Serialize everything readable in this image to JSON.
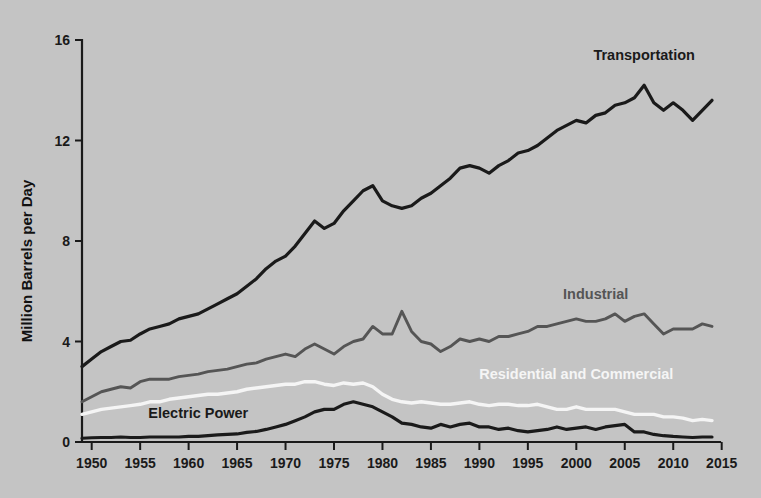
{
  "chart_data": {
    "type": "line",
    "title": "",
    "xlabel": "",
    "ylabel": "Million Barrels per Day",
    "xlim": [
      1949,
      2015
    ],
    "ylim": [
      0,
      16
    ],
    "yticks": [
      0,
      4,
      8,
      12,
      16
    ],
    "xticks": [
      1950,
      1955,
      1960,
      1965,
      1970,
      1975,
      1980,
      1985,
      1990,
      1995,
      2000,
      2005,
      2010,
      2015
    ],
    "grid": false,
    "legend_position": "inline-labels",
    "x": [
      1949,
      1950,
      1951,
      1952,
      1953,
      1954,
      1955,
      1956,
      1957,
      1958,
      1959,
      1960,
      1961,
      1962,
      1963,
      1964,
      1965,
      1966,
      1967,
      1968,
      1969,
      1970,
      1971,
      1972,
      1973,
      1974,
      1975,
      1976,
      1977,
      1978,
      1979,
      1980,
      1981,
      1982,
      1983,
      1984,
      1985,
      1986,
      1987,
      1988,
      1989,
      1990,
      1991,
      1992,
      1993,
      1994,
      1995,
      1996,
      1997,
      1998,
      1999,
      2000,
      2001,
      2002,
      2003,
      2004,
      2005,
      2006,
      2007,
      2008,
      2009,
      2010,
      2011,
      2012,
      2013,
      2014
    ],
    "series": [
      {
        "name": "Transportation",
        "color": "#1a1a1a",
        "label_x": 2007,
        "label_y": 15.2,
        "values": [
          3.0,
          3.3,
          3.6,
          3.8,
          4.0,
          4.05,
          4.3,
          4.5,
          4.6,
          4.7,
          4.9,
          5.0,
          5.1,
          5.3,
          5.5,
          5.7,
          5.9,
          6.2,
          6.5,
          6.9,
          7.2,
          7.4,
          7.8,
          8.3,
          8.8,
          8.5,
          8.7,
          9.2,
          9.6,
          10.0,
          10.2,
          9.6,
          9.4,
          9.3,
          9.4,
          9.7,
          9.9,
          10.2,
          10.5,
          10.9,
          11.0,
          10.9,
          10.7,
          11.0,
          11.2,
          11.5,
          11.6,
          11.8,
          12.1,
          12.4,
          12.6,
          12.8,
          12.7,
          13.0,
          13.1,
          13.4,
          13.5,
          13.7,
          14.2,
          13.5,
          13.2,
          13.5,
          13.2,
          12.8,
          13.2,
          13.6
        ]
      },
      {
        "name": "Industrial",
        "color": "#555555",
        "label_x": 2002,
        "label_y": 5.7,
        "values": [
          1.6,
          1.8,
          2.0,
          2.1,
          2.2,
          2.15,
          2.4,
          2.5,
          2.5,
          2.5,
          2.6,
          2.65,
          2.7,
          2.8,
          2.85,
          2.9,
          3.0,
          3.1,
          3.15,
          3.3,
          3.4,
          3.5,
          3.4,
          3.7,
          3.9,
          3.7,
          3.5,
          3.8,
          4.0,
          4.1,
          4.6,
          4.3,
          4.3,
          5.2,
          4.4,
          4.0,
          3.9,
          3.6,
          3.8,
          4.1,
          4.0,
          4.1,
          4.0,
          4.2,
          4.2,
          4.3,
          4.4,
          4.6,
          4.6,
          4.7,
          4.8,
          4.9,
          4.8,
          4.8,
          4.9,
          5.1,
          4.8,
          5.0,
          5.1,
          4.7,
          4.3,
          4.5,
          4.5,
          4.5,
          4.7,
          4.6
        ]
      },
      {
        "name": "Residential and Commercial",
        "color": "#f5f5f5",
        "label_x": 2000,
        "label_y": 2.5,
        "values": [
          1.1,
          1.2,
          1.3,
          1.35,
          1.4,
          1.45,
          1.5,
          1.6,
          1.6,
          1.7,
          1.75,
          1.8,
          1.85,
          1.9,
          1.9,
          1.95,
          2.0,
          2.1,
          2.15,
          2.2,
          2.25,
          2.3,
          2.3,
          2.4,
          2.4,
          2.3,
          2.25,
          2.35,
          2.3,
          2.35,
          2.2,
          1.9,
          1.7,
          1.6,
          1.55,
          1.6,
          1.55,
          1.5,
          1.5,
          1.55,
          1.6,
          1.5,
          1.45,
          1.5,
          1.5,
          1.45,
          1.45,
          1.5,
          1.4,
          1.3,
          1.3,
          1.4,
          1.3,
          1.3,
          1.3,
          1.3,
          1.2,
          1.1,
          1.1,
          1.1,
          1.0,
          1.0,
          0.95,
          0.85,
          0.9,
          0.85
        ]
      },
      {
        "name": "Electric Power",
        "color": "#1a1a1a",
        "label_x": 1961,
        "label_y": 0.95,
        "values": [
          0.15,
          0.17,
          0.18,
          0.18,
          0.2,
          0.18,
          0.18,
          0.2,
          0.2,
          0.2,
          0.2,
          0.22,
          0.22,
          0.25,
          0.28,
          0.3,
          0.32,
          0.38,
          0.42,
          0.5,
          0.6,
          0.7,
          0.85,
          1.0,
          1.2,
          1.3,
          1.3,
          1.5,
          1.6,
          1.5,
          1.4,
          1.2,
          1.0,
          0.75,
          0.7,
          0.6,
          0.55,
          0.7,
          0.6,
          0.7,
          0.75,
          0.6,
          0.6,
          0.5,
          0.55,
          0.45,
          0.4,
          0.45,
          0.5,
          0.6,
          0.5,
          0.55,
          0.6,
          0.5,
          0.6,
          0.65,
          0.7,
          0.4,
          0.4,
          0.3,
          0.25,
          0.22,
          0.2,
          0.18,
          0.2,
          0.2
        ]
      }
    ]
  },
  "axes": {
    "y_title": "Million Barrels per Day",
    "y_tick_labels": [
      "0",
      "4",
      "8",
      "12",
      "16"
    ],
    "x_tick_labels": [
      "1950",
      "1955",
      "1960",
      "1965",
      "1970",
      "1975",
      "1980",
      "1985",
      "1990",
      "1995",
      "2000",
      "2005",
      "2010",
      "2015"
    ]
  },
  "series_labels": {
    "transportation": "Transportation",
    "industrial": "Industrial",
    "residential": "Residential and Commercial",
    "electric": "Electric Power"
  },
  "colors": {
    "background": "#c4c4c4",
    "transportation": "#1a1a1a",
    "industrial": "#555555",
    "residential": "#f5f5f5",
    "electric": "#1a1a1a",
    "axis": "#1a1a1a"
  }
}
